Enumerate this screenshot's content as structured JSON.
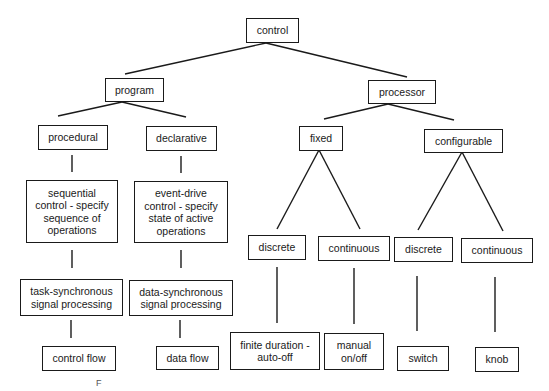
{
  "diagram": {
    "type": "tree",
    "root": "control",
    "nodes": {
      "control": {
        "label": "control"
      },
      "program": {
        "label": "program"
      },
      "processor": {
        "label": "processor"
      },
      "procedural": {
        "label": "procedural"
      },
      "declarative": {
        "label": "declarative"
      },
      "fixed": {
        "label": "fixed"
      },
      "configurable": {
        "label": "configurable"
      },
      "sequential": {
        "label": "sequential\ncontrol - specify\nsequence of\noperations"
      },
      "event_drive": {
        "label": "event-drive\ncontrol - specify\nstate of active\noperations"
      },
      "fixed_discrete": {
        "label": "discrete"
      },
      "fixed_continuous": {
        "label": "continuous"
      },
      "config_discrete": {
        "label": "discrete"
      },
      "config_continuous": {
        "label": "continuous"
      },
      "task_sync": {
        "label": "task-synchronous\nsignal processing"
      },
      "data_sync": {
        "label": "data-synchronous\nsignal processing"
      },
      "control_flow": {
        "label": "control flow"
      },
      "data_flow": {
        "label": "data flow"
      },
      "finite_duration": {
        "label": "finite duration -\nauto-off"
      },
      "manual_onoff": {
        "label": "manual\non/off"
      },
      "switch": {
        "label": "switch"
      },
      "knob": {
        "label": "knob"
      }
    },
    "edges": [
      [
        "control",
        "program"
      ],
      [
        "control",
        "processor"
      ],
      [
        "program",
        "procedural"
      ],
      [
        "program",
        "declarative"
      ],
      [
        "processor",
        "fixed"
      ],
      [
        "processor",
        "configurable"
      ],
      [
        "procedural",
        "sequential"
      ],
      [
        "declarative",
        "event_drive"
      ],
      [
        "sequential",
        "task_sync"
      ],
      [
        "event_drive",
        "data_sync"
      ],
      [
        "task_sync",
        "control_flow"
      ],
      [
        "data_sync",
        "data_flow"
      ],
      [
        "fixed",
        "fixed_discrete"
      ],
      [
        "fixed",
        "fixed_continuous"
      ],
      [
        "configurable",
        "config_discrete"
      ],
      [
        "configurable",
        "config_continuous"
      ],
      [
        "fixed_discrete",
        "finite_duration"
      ],
      [
        "fixed_continuous",
        "manual_onoff"
      ],
      [
        "config_discrete",
        "switch"
      ],
      [
        "config_continuous",
        "knob"
      ]
    ],
    "stray_mark": "F"
  }
}
